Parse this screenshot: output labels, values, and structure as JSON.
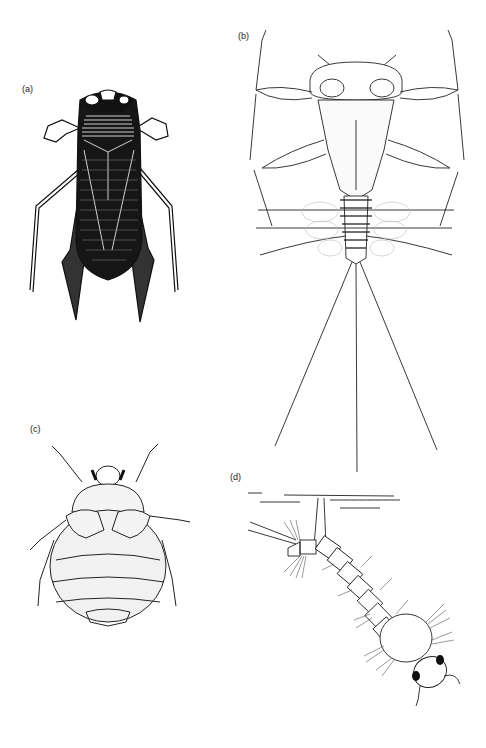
{
  "figure": {
    "panels": [
      {
        "id": "a",
        "label": "(a)",
        "subject": "water-bug-adult"
      },
      {
        "id": "b",
        "label": "(b)",
        "subject": "mayfly-nymph"
      },
      {
        "id": "c",
        "label": "(c)",
        "subject": "beetle-larva-round"
      },
      {
        "id": "d",
        "label": "(d)",
        "subject": "mosquito-larva-at-surface"
      }
    ]
  },
  "colors": {
    "ink": "#111111",
    "paper": "#ffffff",
    "shade": "#f1f1f1"
  }
}
